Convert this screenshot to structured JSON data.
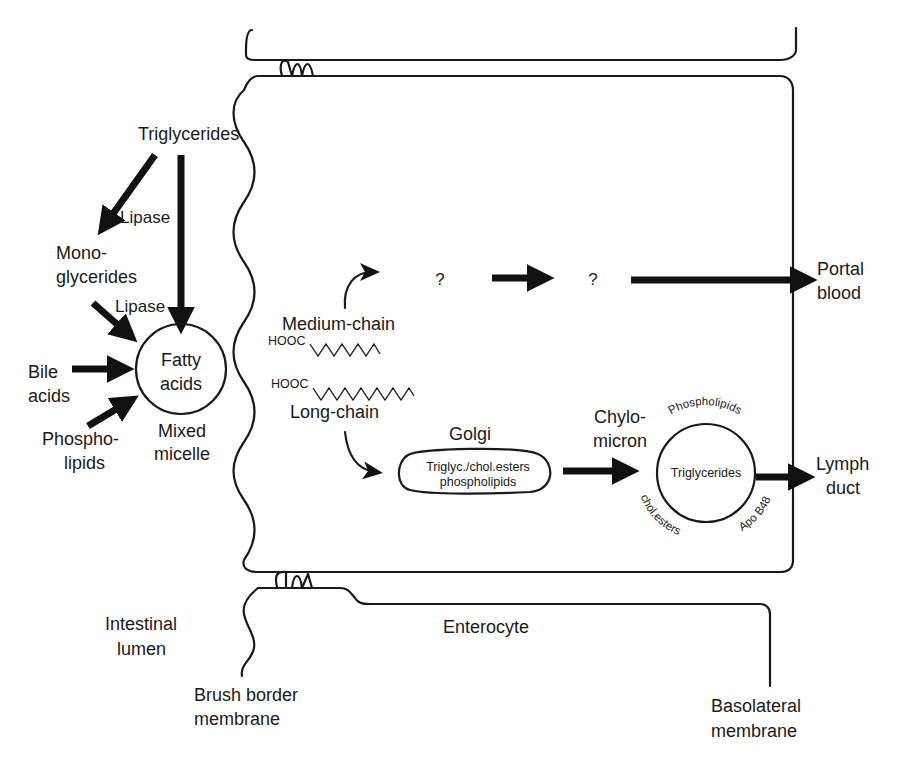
{
  "diagram": {
    "regions": {
      "lumen": "Intestinal\nlumen",
      "lumen_line1": "Intestinal",
      "lumen_line2": "lumen",
      "enterocyte": "Enterocyte",
      "brush_border_line1": "Brush border",
      "brush_border_line2": "membrane",
      "basolateral_line1": "Basolateral",
      "basolateral_line2": "membrane"
    },
    "lumen_digestion": {
      "triglycerides": "Triglycerides",
      "lipase_1": "Lipase",
      "monoglycerides_line1": "Mono-",
      "monoglycerides_line2": "glycerides",
      "lipase_2": "Lipase",
      "bile_acids_line1": "Bile",
      "bile_acids_line2": "acids",
      "phospholipids_line1": "Phospho-",
      "phospholipids_line2": "lipids",
      "micelle_core_line1": "Fatty",
      "micelle_core_line2": "acids",
      "micelle_label_line1": "Mixed",
      "micelle_label_line2": "micelle"
    },
    "enterocyte_pathways": {
      "medium_chain": "Medium-chain",
      "long_chain": "Long-chain",
      "hooc_1": "HOOC",
      "hooc_2": "HOOC",
      "unknown_1": "?",
      "unknown_2": "?",
      "golgi": "Golgi",
      "golgi_content_line1": "Triglyc./chol.esters",
      "golgi_content_line2": "phospholipids",
      "chylomicron_line1": "Chylo-",
      "chylomicron_line2": "micron",
      "chylo_core": "Triglycerides",
      "chylo_top": "Phospholipids",
      "chylo_bottom_left": "chol.esters",
      "chylo_bottom_right": "Apo B48"
    },
    "destinations": {
      "portal_line1": "Portal",
      "portal_line2": "blood",
      "lymph_line1": "Lymph",
      "lymph_line2": "duct"
    }
  }
}
